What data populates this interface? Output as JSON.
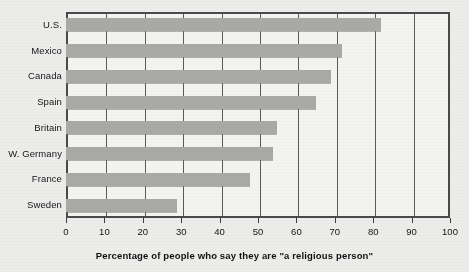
{
  "chart_data": {
    "type": "bar",
    "orientation": "horizontal",
    "title": "",
    "xlabel": "Percentage of people who say they are \"a religious person\"",
    "ylabel": "",
    "xlim": [
      0,
      100
    ],
    "xticks": [
      0,
      10,
      20,
      30,
      40,
      50,
      60,
      70,
      80,
      90,
      100
    ],
    "xtick_labels": [
      "0",
      "10",
      "20",
      "30",
      "40",
      "50",
      "60",
      "70",
      "80",
      "90",
      "100"
    ],
    "grid": true,
    "grid_axis": "x",
    "legend": "none",
    "categories": [
      "U.S.",
      "Mexico",
      "Canada",
      "Spain",
      "Britain",
      "W. Germany",
      "France",
      "Sweden"
    ],
    "values": [
      82,
      72,
      69,
      65,
      55,
      54,
      48,
      29
    ],
    "bar_color": "#a9a9a7",
    "plot_background": "#f3f3f2",
    "frame_color": "#4a4a4a",
    "page_background": "#ececeb"
  }
}
